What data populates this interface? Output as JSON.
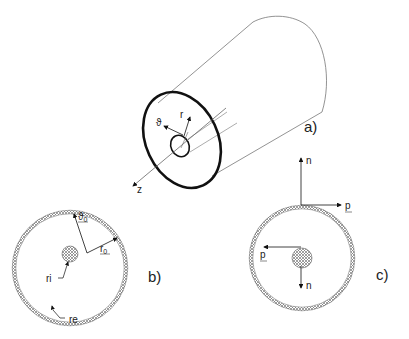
{
  "figure": {
    "panels": [
      {
        "id": "a",
        "label": "a)",
        "description": "cylinder with annular cross-section",
        "axis_labels": {
          "theta": "ϑ",
          "r": "r",
          "z": "z"
        }
      },
      {
        "id": "b",
        "label": "b)",
        "description": "cross-section with inner and outer radii",
        "labels": {
          "theta0": "ϑ",
          "theta0_sub": "0",
          "r0": "r",
          "r0_sub": "0",
          "ri": "ri",
          "re": "re"
        }
      },
      {
        "id": "c",
        "label": "c)",
        "description": "cross-section with normal and tangent vectors",
        "labels": {
          "n_outer": "n",
          "p_outer": "p",
          "p_inner": "p",
          "n_inner": "n"
        }
      }
    ],
    "colors": {
      "stroke": "#111111",
      "thin": "#555555",
      "hatch": "#888888"
    }
  }
}
